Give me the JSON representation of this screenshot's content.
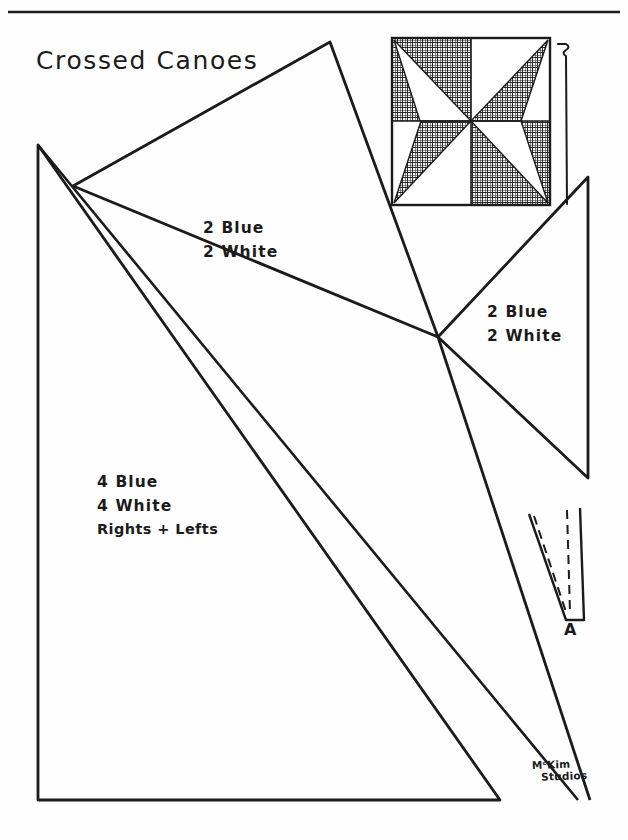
{
  "sheet": {
    "title": "Crossed Canoes",
    "signature_line1": "MᶜKim",
    "signature_line2": "Studios",
    "ink_color": "#1b1b1b",
    "paper_color": "#fefefe"
  },
  "block_diagram": {
    "name": "crossed-canoes-block",
    "grid": "2x2",
    "quadrants": [
      {
        "position": "top-left",
        "background": "blue",
        "canoe": "white",
        "canoe_from": "top-left-corner"
      },
      {
        "position": "top-right",
        "background": "white",
        "canoe": "blue",
        "canoe_from": "top-right-corner"
      },
      {
        "position": "bottom-left",
        "background": "white",
        "canoe": "blue",
        "canoe_from": "bottom-left-corner"
      },
      {
        "position": "bottom-right",
        "background": "blue",
        "canoe": "white",
        "canoe_from": "bottom-right-corner"
      }
    ],
    "blue_fill": "crosshatch",
    "white_fill": "plain"
  },
  "pieces": [
    {
      "id": "large-triangle",
      "blue_count": "2 Blue",
      "white_count": "2 White",
      "note": ""
    },
    {
      "id": "right-triangle",
      "blue_count": "2 Blue",
      "white_count": "2 White",
      "note": ""
    },
    {
      "id": "canoe-sliver",
      "blue_count": "4 Blue",
      "white_count": "4 White",
      "note": "Rights + Lefts"
    }
  ],
  "template_a": {
    "letter": "A",
    "seam_style": "dashed"
  }
}
